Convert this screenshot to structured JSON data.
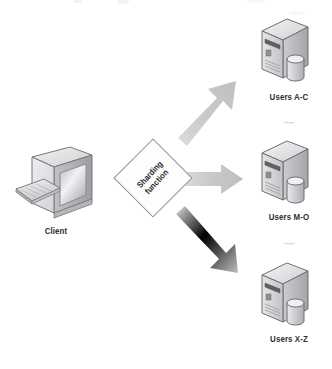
{
  "diagram": {
    "background_color": "#ffffff",
    "client": {
      "label": "Client",
      "icon": "crt-monitor-icon",
      "keyboard_icon": "keyboard-icon"
    },
    "sharding": {
      "shape": "diamond",
      "label_line1": "Sharding",
      "label_line2": "function",
      "text_rotation_deg": -47,
      "outline_color": "#8c8c90",
      "fill_color": "#fdfdfd"
    },
    "arrows": [
      {
        "name": "arrow-to-shard-1",
        "direction": "up-right",
        "color": "#c6c6c8"
      },
      {
        "name": "arrow-to-shard-2",
        "direction": "right",
        "color": "#c6c6c8"
      },
      {
        "name": "arrow-to-shard-3",
        "direction": "down-right",
        "color": "#c6c6c8"
      }
    ],
    "shards": [
      {
        "label": "Users A-C",
        "icon": "server-tower-icon",
        "database_icon": "database-cylinder-icon"
      },
      {
        "label": "Users M-O",
        "icon": "server-tower-icon",
        "database_icon": "database-cylinder-icon"
      },
      {
        "label": "Users X-Z",
        "icon": "server-tower-icon",
        "database_icon": "database-cylinder-icon"
      }
    ],
    "separators": [
      {
        "name": "shard-ellipsis-1",
        "text": "····"
      },
      {
        "name": "shard-ellipsis-2",
        "text": "····"
      }
    ],
    "colors": {
      "label_text": "#2e2e2e",
      "arrow_fill": "#c6c6c8",
      "server_body": "#d3d3d6",
      "outline": "#6f6f73"
    }
  }
}
